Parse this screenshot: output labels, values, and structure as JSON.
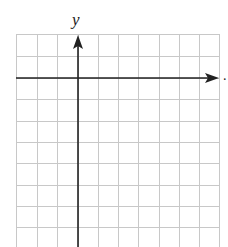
{
  "diagram": {
    "type": "coordinate-grid",
    "x_axis_label": "x",
    "y_axis_label": "y",
    "trailing_mark": ".",
    "grid": {
      "columns": 10,
      "rows_visible": 10,
      "x_lines": [
        16,
        37,
        57,
        78,
        98,
        118,
        138,
        159,
        179,
        199,
        219
      ],
      "y_lines": [
        34,
        56,
        78,
        99,
        121,
        142,
        163,
        185,
        206,
        227
      ],
      "line_color": "#c8c8c8"
    },
    "axes": {
      "origin_px": [
        78,
        78
      ],
      "color": "#222222"
    }
  }
}
